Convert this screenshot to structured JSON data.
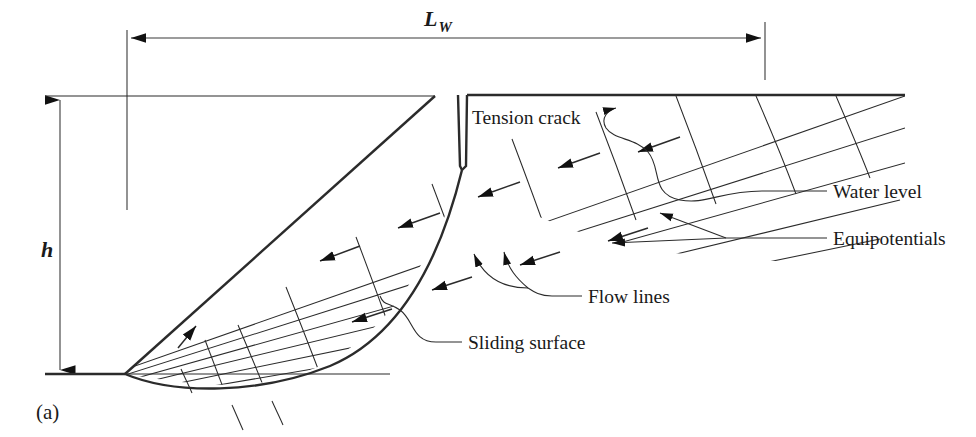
{
  "figure": {
    "caption": "(a)",
    "title_note": "Flow net in a slope with a tension crack"
  },
  "dimensions": {
    "horizontal": {
      "label_main": "L",
      "label_sub": "W",
      "name": "water-filled length along sliding surface"
    },
    "vertical": {
      "label": "h",
      "name": "slope height"
    }
  },
  "labels": [
    {
      "id": "tension-crack",
      "text": "Tension crack"
    },
    {
      "id": "water-level",
      "text": "Water level"
    },
    {
      "id": "equipotentials",
      "text": "Equipotentials"
    },
    {
      "id": "flow-lines",
      "text": "Flow lines"
    },
    {
      "id": "sliding-surface",
      "text": "Sliding surface"
    }
  ],
  "colors": {
    "ink": "#2b2b2b",
    "ink_dark": "#111111",
    "dimension": "#3a3a3a",
    "background": "#ffffff"
  },
  "geometry": {
    "ground_line_y": 374,
    "crest_line_y": 96,
    "slope_toe_x": 125,
    "slope_crest_x": 435,
    "tension_crack_x": 462,
    "tension_crack_depth_y": 170,
    "flow_line_count": 5,
    "equipotential_count": 7,
    "flow_arrow_count": 10
  },
  "icon_names": {
    "dim_arrow_left": "arrow-left-icon",
    "dim_arrow_right": "arrow-right-icon",
    "dim_arrow_up": "arrow-up-icon",
    "dim_arrow_down": "arrow-down-icon",
    "flow_arrow": "flow-direction-arrow-icon"
  }
}
